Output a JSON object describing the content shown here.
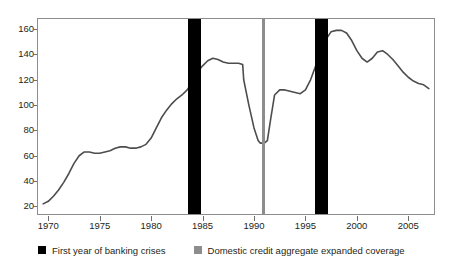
{
  "figure": {
    "title": "",
    "title_cropped": true
  },
  "chart_data": {
    "type": "line",
    "title": "",
    "xlabel": "",
    "ylabel": "",
    "xlim": [
      1969,
      2007.5
    ],
    "ylim": [
      14,
      168
    ],
    "grid": false,
    "legend_position": "bottom",
    "x_ticks": [
      1970,
      1975,
      1980,
      1985,
      1990,
      1995,
      2000,
      2005
    ],
    "y_ticks": [
      20,
      40,
      60,
      80,
      100,
      120,
      140,
      160
    ],
    "series": [
      {
        "name": "Domestic credit aggregate",
        "color": "#4d4d4d",
        "x": [
          1969.5,
          1970,
          1970.5,
          1971,
          1971.5,
          1972,
          1972.5,
          1973,
          1973.5,
          1974,
          1974.5,
          1975,
          1975.5,
          1976,
          1976.5,
          1977,
          1977.5,
          1978,
          1978.5,
          1979,
          1979.5,
          1980,
          1980.5,
          1981,
          1981.5,
          1982,
          1982.5,
          1983,
          1983.5,
          1984,
          1984.5,
          1985,
          1985.5,
          1986,
          1986.5,
          1987,
          1987.5,
          1988,
          1988.5,
          1988.9,
          1989,
          1989.5,
          1990,
          1990.4,
          1990.6,
          1991,
          1991.3,
          1991.6,
          1992,
          1992.5,
          1993,
          1993.5,
          1994,
          1994.5,
          1995,
          1995.5,
          1996,
          1996.5,
          1997,
          1997.5,
          1998,
          1998.5,
          1999,
          1999.5,
          2000,
          2000.5,
          2001,
          2001.5,
          2002,
          2002.5,
          2003,
          2003.5,
          2004,
          2004.5,
          2005,
          2005.5,
          2006,
          2006.5,
          2007
        ],
        "y": [
          22,
          24,
          28,
          33,
          39,
          46,
          54,
          60,
          63,
          63,
          62,
          62,
          63,
          64,
          66,
          67,
          67,
          66,
          66,
          67,
          69,
          74,
          82,
          90,
          96,
          101,
          105,
          108,
          112,
          118,
          126,
          131,
          135,
          137,
          136,
          134,
          133,
          133,
          133,
          132,
          120,
          100,
          82,
          72,
          70,
          70,
          72,
          88,
          108,
          112,
          112,
          111,
          110,
          109,
          112,
          120,
          131,
          143,
          152,
          158,
          159,
          159,
          157,
          151,
          143,
          137,
          134,
          137,
          142,
          143,
          140,
          136,
          131,
          126,
          122,
          119,
          117,
          116,
          113
        ]
      }
    ],
    "event_bands": [
      {
        "label": "First year of banking crises",
        "color": "#000000",
        "x_start": 1983.6,
        "x_end": 1984.9,
        "width_px": 13
      },
      {
        "label": "Domestic credit aggregate expanded coverage",
        "color": "#8d8d8d",
        "x_start": 1990.8,
        "x_end": 1991.1,
        "width_px": 3
      },
      {
        "label": "First year of banking crises",
        "color": "#000000",
        "x_start": 1995.9,
        "x_end": 1997.2,
        "width_px": 13
      }
    ]
  },
  "legend": {
    "items": [
      {
        "label": "First year of banking crises",
        "color": "#000000"
      },
      {
        "label": "Domestic credit aggregate expanded coverage",
        "color": "#8d8d8d"
      }
    ]
  },
  "colors": {
    "line": "#4d4d4d",
    "crisis_band": "#000000",
    "coverage_band": "#8d8d8d",
    "axis": "#8d8d8d",
    "text": "#231f20",
    "background": "#ffffff"
  }
}
